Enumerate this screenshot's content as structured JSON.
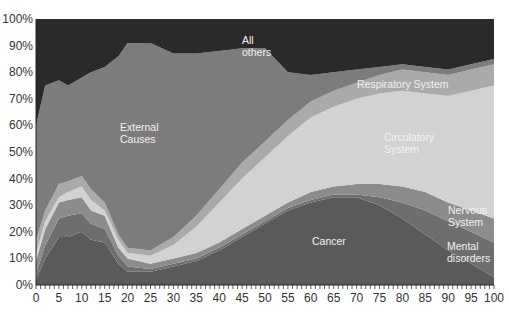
{
  "chart_data": {
    "type": "area",
    "stacked": true,
    "normalized": true,
    "title": "",
    "xlabel": "",
    "ylabel": "",
    "xlim": [
      0,
      100
    ],
    "ylim": [
      0,
      100
    ],
    "x_ticks": [
      0,
      5,
      10,
      15,
      20,
      25,
      30,
      35,
      40,
      45,
      50,
      55,
      60,
      65,
      70,
      75,
      80,
      85,
      90,
      95,
      100
    ],
    "y_ticks": [
      "0%",
      "10%",
      "20%",
      "30%",
      "40%",
      "50%",
      "60%",
      "70%",
      "80%",
      "90%",
      "100%"
    ],
    "grid": false,
    "legend": "inline labels",
    "x": [
      0,
      2,
      5,
      7,
      10,
      12,
      15,
      18,
      20,
      25,
      30,
      35,
      40,
      45,
      50,
      55,
      60,
      65,
      70,
      75,
      80,
      85,
      90,
      95,
      100
    ],
    "series": [
      {
        "name": "Cancer",
        "color": "#5a5a5a",
        "values": [
          2,
          10,
          18,
          18,
          20,
          17,
          16,
          8,
          5,
          5,
          7,
          9,
          13,
          18,
          23,
          28,
          31,
          33,
          33,
          30,
          25,
          19,
          13,
          8,
          3
        ]
      },
      {
        "name": "Mental disorders",
        "color": "#6e6e6e",
        "values": [
          2,
          5,
          7,
          8,
          7,
          6,
          5,
          3,
          2,
          1,
          1,
          1,
          1,
          1,
          1,
          1,
          1,
          1,
          1,
          3,
          6,
          9,
          11,
          12,
          13
        ]
      },
      {
        "name": "Nervous System",
        "color": "#8c8c8c",
        "values": [
          5,
          6,
          6,
          6,
          6,
          5,
          5,
          3,
          3,
          2,
          2,
          2,
          2,
          2,
          2,
          2,
          3,
          3,
          4,
          5,
          6,
          7,
          7,
          8,
          9
        ]
      },
      {
        "name": "Circulatory System",
        "color": "#d2d2d2",
        "values": [
          3,
          3,
          2,
          3,
          4,
          4,
          2,
          3,
          2,
          3,
          5,
          10,
          15,
          19,
          22,
          25,
          28,
          30,
          32,
          34,
          36,
          37,
          40,
          45,
          50
        ]
      },
      {
        "name": "Respiratory System",
        "color": "#aaaaaa",
        "values": [
          5,
          4,
          5,
          4,
          4,
          4,
          3,
          2,
          2,
          2,
          3,
          4,
          5,
          6,
          6,
          6,
          6,
          6,
          6,
          7,
          8,
          8,
          8,
          8,
          8
        ]
      },
      {
        "name": "External Causes",
        "color": "#7c7c7c",
        "values": [
          43,
          47,
          39,
          36,
          37,
          44,
          51,
          67,
          77,
          78,
          69,
          61,
          52,
          43,
          35,
          18,
          10,
          7,
          5,
          3,
          2,
          2,
          2,
          2,
          2
        ]
      },
      {
        "name": "All others",
        "color": "#2a2a2a",
        "values": [
          40,
          25,
          23,
          25,
          22,
          20,
          18,
          14,
          9,
          9,
          13,
          13,
          12,
          11,
          11,
          20,
          21,
          20,
          19,
          18,
          17,
          18,
          19,
          17,
          15
        ]
      }
    ],
    "annotations": [
      {
        "text": "All others",
        "x": 47,
        "y": 92
      },
      {
        "text": "External Causes",
        "x": 15,
        "y": 57
      },
      {
        "text": "Respiratory System",
        "x": 75,
        "y": 75
      },
      {
        "text": "Circulatory System",
        "x": 80,
        "y": 52
      },
      {
        "text": "Nervous System",
        "x": 94,
        "y": 24
      },
      {
        "text": "Cancer",
        "x": 63,
        "y": 12
      },
      {
        "text": "Mental disorders",
        "x": 94,
        "y": 14
      }
    ]
  },
  "labels": {
    "all_others_1": "All",
    "all_others_2": "others",
    "external_1": "External",
    "external_2": "Causes",
    "respiratory": "Respiratory System",
    "circulatory_1": "Circulatory",
    "circulatory_2": "System",
    "nervous_1": "Nervous",
    "nervous_2": "System",
    "cancer": "Cancer",
    "mental_1": "Mental",
    "mental_2": "disorders"
  },
  "y_axis": [
    "0%",
    "10%",
    "20%",
    "30%",
    "40%",
    "50%",
    "60%",
    "70%",
    "80%",
    "90%",
    "100%"
  ],
  "x_axis": [
    "0",
    "5",
    "10",
    "15",
    "20",
    "25",
    "30",
    "35",
    "40",
    "45",
    "50",
    "55",
    "60",
    "65",
    "70",
    "75",
    "80",
    "85",
    "90",
    "95",
    "100"
  ]
}
